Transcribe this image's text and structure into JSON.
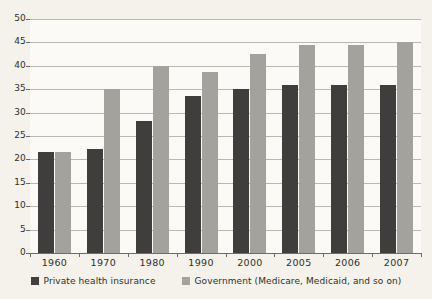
{
  "chart_data": {
    "type": "bar",
    "title": "",
    "xlabel": "",
    "ylabel": "",
    "categories": [
      "1960",
      "1970",
      "1980",
      "1990",
      "2000",
      "2005",
      "2006",
      "2007"
    ],
    "series": [
      {
        "name": "Private health insurance",
        "color": "#3f3e3c",
        "values": [
          21.5,
          22.3,
          28.3,
          33.5,
          35.0,
          36.0,
          35.8,
          35.8
        ]
      },
      {
        "name": "Government (Medicare, Medicaid, and so on)",
        "color": "#a3a29c",
        "values": [
          21.5,
          35.0,
          40.0,
          38.7,
          42.5,
          44.5,
          44.5,
          45.0
        ]
      }
    ],
    "ylim": [
      0,
      50
    ],
    "y_ticks": [
      "0",
      "5",
      "10",
      "15",
      "20",
      "25",
      "30",
      "35",
      "40",
      "45",
      "50"
    ],
    "grid": true,
    "legend_position": "bottom"
  },
  "legend": {
    "entries": [
      {
        "label": "Private health insurance"
      },
      {
        "label": "Government (Medicare, Medicaid, and so on)"
      }
    ]
  },
  "colors": {
    "private": "#3f3e3c",
    "government": "#a3a29c",
    "plot_background": "#fbfaf6",
    "page_background": "#f4f2ea",
    "axis": "#6d6c66",
    "grid": "#b9b8b1",
    "text": "#2f2f2d"
  }
}
